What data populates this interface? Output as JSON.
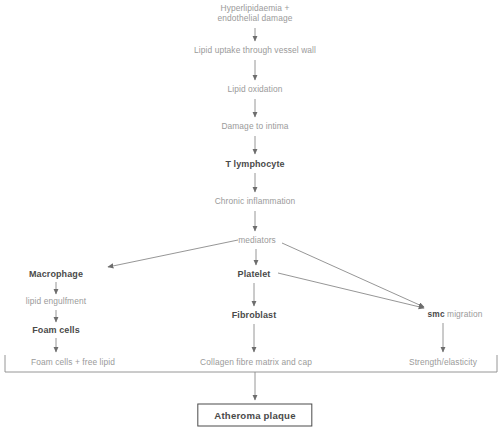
{
  "diagram": {
    "colors": {
      "plain_text": "#9a9a9a",
      "bold_text": "#4a4a4a",
      "connector": "#8a8a8a",
      "box_border": "#4a4a4a",
      "background": "#ffffff"
    },
    "nodes": [
      {
        "id": "hyperlipidaemia",
        "label_line1": "Hyperlipidaemia +",
        "label_line2": "endothelial damage",
        "style": "plain",
        "x": 255,
        "y": 14
      },
      {
        "id": "lipid-uptake",
        "label": "Lipid uptake through vessel wall",
        "style": "plain",
        "x": 255,
        "y": 51
      },
      {
        "id": "lipid-oxidation",
        "label": "Lipid oxidation",
        "style": "plain",
        "x": 255,
        "y": 90
      },
      {
        "id": "damage-to-intima",
        "label": "Damage to intima",
        "style": "plain",
        "x": 255,
        "y": 127
      },
      {
        "id": "t-lymphocyte",
        "label": "T lymphocyte",
        "style": "bold",
        "x": 255,
        "y": 164
      },
      {
        "id": "chronic-inflammation",
        "label": "Chronic inflammation",
        "style": "plain",
        "x": 255,
        "y": 202
      },
      {
        "id": "mediators",
        "label": "mediators",
        "style": "plain",
        "x": 257,
        "y": 241
      },
      {
        "id": "macrophage",
        "label": "Macrophage",
        "style": "bold",
        "x": 56,
        "y": 274
      },
      {
        "id": "platelet",
        "label": "Platelet",
        "style": "bold",
        "x": 254,
        "y": 274
      },
      {
        "id": "smc-migration",
        "label_strong": "smc",
        "label_plain": " migration",
        "style": "mixed",
        "x": 455,
        "y": 315
      },
      {
        "id": "lipid-engulfment",
        "label": "lipid engulfment",
        "style": "plain",
        "x": 56,
        "y": 302
      },
      {
        "id": "foam-cells",
        "label": "Foam cells",
        "style": "bold",
        "x": 56,
        "y": 330
      },
      {
        "id": "fibroblast",
        "label": "Fibroblast",
        "style": "bold",
        "x": 254,
        "y": 315
      },
      {
        "id": "foam-cells-free-lipid",
        "label": "Foam cells + free lipid",
        "style": "plain",
        "x": 73,
        "y": 363
      },
      {
        "id": "collagen-fibre-matrix",
        "label": "Collagen fibre matrix and cap",
        "style": "plain",
        "x": 256,
        "y": 363
      },
      {
        "id": "strength-elasticity",
        "label": "Strength/elasticity",
        "style": "plain",
        "x": 443,
        "y": 363
      },
      {
        "id": "atheroma-plaque",
        "label": "Atheroma plaque",
        "style": "box",
        "x": 255,
        "y": 415
      }
    ],
    "caption": ""
  }
}
